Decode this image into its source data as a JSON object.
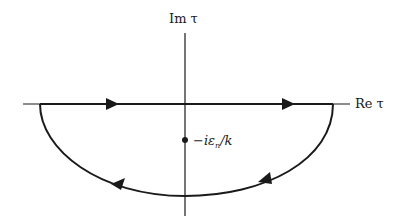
{
  "diagram": {
    "type": "contour-integral",
    "axes": {
      "vertical_label": "Im τ",
      "horizontal_label": "Re τ"
    },
    "pole": {
      "label": "−iε",
      "label_subscript": "n",
      "label_tail": "/k"
    },
    "contour": {
      "description": "Closed contour along real axis (left to right) closing with a large semicircle in the lower half-plane, traversed clockwise, enclosing the pole."
    },
    "colors": {
      "ink": "#1a1a1a",
      "background": "#ffffff"
    }
  }
}
